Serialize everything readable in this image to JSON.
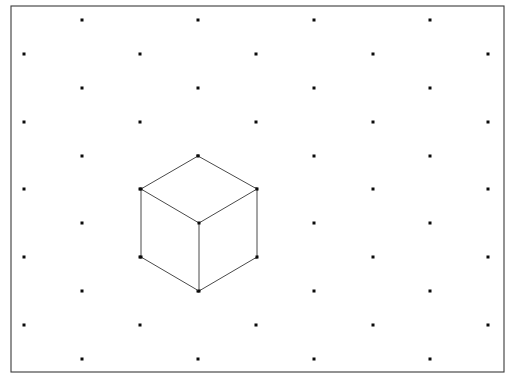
{
  "figure": {
    "background_color": "#ffffff",
    "width": 515,
    "height": 385
  },
  "frame": {
    "name": "border-frame",
    "x": 11,
    "y": 6,
    "width": 493,
    "height": 366,
    "stroke_color": "#3a3a3a",
    "stroke_width": 1.1,
    "fill_color": "#ffffff"
  },
  "grid": {
    "name": "isometric-dot-grid",
    "dot_color": "#0b0b0b",
    "dot_size": 3,
    "row_spacing": 33.8,
    "column_spacing": 116,
    "stagger_offset": 58,
    "rows": [
      {
        "y": 20,
        "xs": [
          82,
          198,
          314,
          430
        ]
      },
      {
        "y": 54,
        "xs": [
          24,
          140,
          256,
          373,
          488
        ]
      },
      {
        "y": 88,
        "xs": [
          82,
          198,
          314,
          430
        ]
      },
      {
        "y": 122,
        "xs": [
          24,
          140,
          256,
          373,
          488
        ]
      },
      {
        "y": 156,
        "xs": [
          82,
          198,
          314,
          430
        ]
      },
      {
        "y": 189,
        "xs": [
          24,
          140,
          256,
          373,
          488
        ]
      },
      {
        "y": 223,
        "xs": [
          82,
          198,
          314,
          430
        ]
      },
      {
        "y": 257,
        "xs": [
          24,
          140,
          256,
          373,
          488
        ]
      },
      {
        "y": 291,
        "xs": [
          82,
          198,
          314,
          430
        ]
      },
      {
        "y": 325,
        "xs": [
          24,
          140,
          256,
          373,
          488
        ]
      },
      {
        "y": 359,
        "xs": [
          82,
          198,
          314,
          430
        ]
      }
    ]
  },
  "cube": {
    "name": "isometric-cube",
    "projection": "isometric",
    "edge_color": "#4a4a4a",
    "edge_width": 1,
    "face_color": "#ffffff",
    "vertex_color": "#0b0b0b",
    "vertex_size": 3,
    "vertices": {
      "top": {
        "x": 198,
        "y": 156
      },
      "top_left": {
        "x": 141,
        "y": 189
      },
      "top_right": {
        "x": 257,
        "y": 189
      },
      "center": {
        "x": 199,
        "y": 223
      },
      "bottom_left": {
        "x": 141,
        "y": 257
      },
      "bottom_right": {
        "x": 257,
        "y": 257
      },
      "bottom": {
        "x": 199,
        "y": 291
      }
    },
    "faces": [
      {
        "name": "top-face",
        "points": "198,156 257,189 199,223 141,189"
      },
      {
        "name": "left-face",
        "points": "141,189 199,223 199,291 141,257"
      },
      {
        "name": "right-face",
        "points": "199,223 257,189 257,257 199,291"
      }
    ],
    "edges": [
      {
        "name": "edge-top-to-top-left",
        "x1": 198,
        "y1": 156,
        "x2": 141,
        "y2": 189
      },
      {
        "name": "edge-top-to-top-right",
        "x1": 198,
        "y1": 156,
        "x2": 257,
        "y2": 189
      },
      {
        "name": "edge-top-left-to-center",
        "x1": 141,
        "y1": 189,
        "x2": 199,
        "y2": 223
      },
      {
        "name": "edge-top-right-to-center",
        "x1": 257,
        "y1": 189,
        "x2": 199,
        "y2": 223
      },
      {
        "name": "edge-top-left-to-bottom-left",
        "x1": 141,
        "y1": 189,
        "x2": 141,
        "y2": 257
      },
      {
        "name": "edge-top-right-to-bottom-right",
        "x1": 257,
        "y1": 189,
        "x2": 257,
        "y2": 257
      },
      {
        "name": "edge-center-to-bottom",
        "x1": 199,
        "y1": 223,
        "x2": 199,
        "y2": 291
      },
      {
        "name": "edge-bottom-left-to-bottom",
        "x1": 141,
        "y1": 257,
        "x2": 199,
        "y2": 291
      },
      {
        "name": "edge-bottom-right-to-bottom",
        "x1": 257,
        "y1": 257,
        "x2": 199,
        "y2": 291
      }
    ]
  }
}
